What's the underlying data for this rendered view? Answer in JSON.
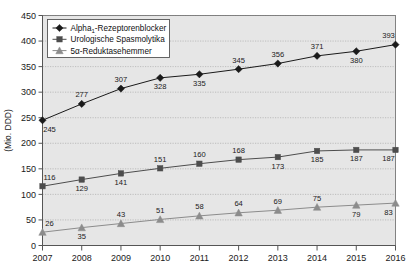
{
  "chart_data": {
    "type": "line",
    "title": "",
    "xlabel": "",
    "ylabel": "(Mio. DDD)",
    "categories": [
      "2007",
      "2008",
      "2009",
      "2010",
      "2011",
      "2012",
      "2013",
      "2014",
      "2015",
      "2016"
    ],
    "ylim": [
      0,
      450
    ],
    "ytick_step": 50,
    "yticks": [
      "0",
      "50",
      "100",
      "150",
      "200",
      "250",
      "300",
      "350",
      "400",
      "450"
    ],
    "grid": true,
    "legend_position": "top-left",
    "series": [
      {
        "name": "Alpha1-Rezeptorenblocker",
        "name_prefix": "Alpha",
        "name_sub": "1",
        "name_suffix": "-Rezeptorenblocker",
        "marker": "diamond",
        "color": "#1a1a1a",
        "values": [
          245,
          277,
          307,
          328,
          335,
          345,
          356,
          371,
          380,
          393
        ],
        "label_positions": [
          "below",
          "above",
          "above",
          "below",
          "below",
          "above",
          "above",
          "above",
          "below",
          "above"
        ]
      },
      {
        "name": "Urologische Spasmolytika",
        "name_prefix": "Urologische Spasmolytika",
        "name_sub": "",
        "name_suffix": "",
        "marker": "square",
        "color": "#4d4d4d",
        "values": [
          116,
          129,
          141,
          151,
          160,
          168,
          173,
          185,
          187,
          187
        ],
        "label_positions": [
          "above",
          "below",
          "below",
          "above",
          "above",
          "above",
          "below",
          "below",
          "below",
          "below"
        ]
      },
      {
        "name": "5a-Reduktasehemmer",
        "name_prefix": "5α-Reduktasehemmer",
        "name_sub": "",
        "name_suffix": "",
        "marker": "triangle",
        "color": "#8c8c8c",
        "values": [
          26,
          35,
          43,
          51,
          58,
          64,
          69,
          75,
          79,
          83
        ],
        "label_positions": [
          "above",
          "below",
          "above",
          "above",
          "above",
          "above",
          "above",
          "above",
          "below",
          "below"
        ]
      }
    ],
    "colors": {
      "plot_background": "#e6e6e6",
      "grid": "#b3b3b3",
      "axis": "#555555",
      "text": "#1a1a1a"
    }
  }
}
